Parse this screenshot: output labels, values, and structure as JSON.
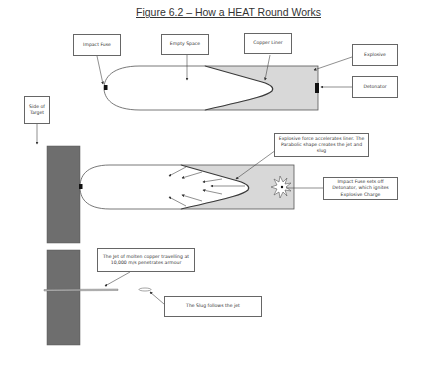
{
  "title": "Figure 6.2 – How a HEAT Round Works",
  "colors": {
    "target": "#6e6e6e",
    "explosive_fill": "#d8d8d8",
    "liner": "#3a3a3a",
    "outline": "#555555",
    "fuse": "#111111"
  },
  "panel1": {
    "labels": {
      "impact_fuse": "Impact Fuse",
      "empty_space": "Empty Space",
      "copper_liner": "Copper Liner",
      "explosive": "Explosive",
      "detonator": "Detonator"
    }
  },
  "panel2": {
    "labels": {
      "side_of_target": "Side of Target",
      "explosive_force": "Explosive force accelerates liner. The Parabolic shape creates the jet and slug",
      "impact_fuse_sets_off": "Impact Fuse sets off Detonator, which ignites Explosive Charge"
    }
  },
  "panel3": {
    "labels": {
      "jet": "The Jet of molten copper travelling at 10,000 m/s penetrates armour",
      "slug": "The Slug follows the jet"
    }
  }
}
